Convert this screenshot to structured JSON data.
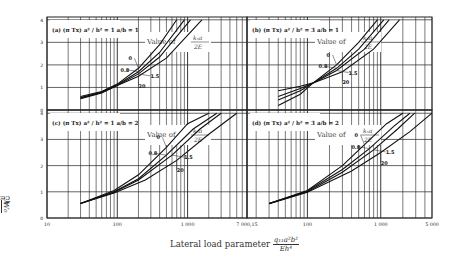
{
  "chart_data": {
    "type": "line",
    "title": "",
    "xlabel": "Lateral load parameter q11 a^2 b^2 / (E h^4)",
    "ylabel": "center deflection W0 / h",
    "x_scale": "log",
    "ylim": [
      0,
      4
    ],
    "legend_title": "Value of kx a / 2E",
    "series_keys": [
      "0",
      "0.8",
      "1.5",
      "20"
    ],
    "x_ticks_left": [
      "10",
      "100",
      "1 000",
      "7 000,15"
    ],
    "x_ticks_right": [
      "100",
      "1 000",
      "5 000"
    ],
    "y_ticks": [
      "0",
      "1",
      "2",
      "3",
      "4"
    ],
    "panels": [
      {
        "id": "a",
        "label": "(a)",
        "param": "(π Tx) a² / h² = 1",
        "ratio": "a/b = 1",
        "xrange": [
          10,
          7000
        ],
        "series": [
          {
            "name": "0",
            "x": [
              30,
              60,
              100,
              200,
              400,
              700
            ],
            "y": [
              0.6,
              0.82,
              1.15,
              1.85,
              2.9,
              4.0
            ]
          },
          {
            "name": "0.8",
            "x": [
              30,
              60,
              100,
              200,
              400,
              900
            ],
            "y": [
              0.55,
              0.8,
              1.12,
              1.7,
              2.55,
              4.0
            ]
          },
          {
            "name": "1.5",
            "x": [
              30,
              60,
              100,
              200,
              400,
              1100
            ],
            "y": [
              0.52,
              0.78,
              1.1,
              1.6,
              2.35,
              4.0
            ]
          },
          {
            "name": "20",
            "x": [
              30,
              60,
              100,
              200,
              500,
              1600
            ],
            "y": [
              0.5,
              0.76,
              1.08,
              1.5,
              2.3,
              4.0
            ]
          }
        ]
      },
      {
        "id": "b",
        "label": "(b)",
        "param": "(π Tx) a² / h² = 3",
        "ratio": "a/b = 1",
        "xrange": [
          15,
          5000
        ],
        "series": [
          {
            "name": "0",
            "x": [
              40,
              80,
              120,
              250,
              500,
              900
            ],
            "y": [
              0.2,
              0.7,
              1.2,
              2.0,
              3.0,
              4.0
            ]
          },
          {
            "name": "0.8",
            "x": [
              40,
              80,
              120,
              250,
              500,
              1100
            ],
            "y": [
              0.45,
              0.85,
              1.2,
              1.85,
              2.7,
              4.0
            ]
          },
          {
            "name": "1.5",
            "x": [
              40,
              80,
              120,
              250,
              600,
              1300
            ],
            "y": [
              0.6,
              0.95,
              1.2,
              1.75,
              2.7,
              4.0
            ]
          },
          {
            "name": "20",
            "x": [
              40,
              80,
              120,
              300,
              800,
              1800
            ],
            "y": [
              0.85,
              1.05,
              1.2,
              1.7,
              2.7,
              4.0
            ]
          }
        ]
      },
      {
        "id": "c",
        "label": "(c)",
        "param": "(π Tx) a² / h² = 1",
        "ratio": "a/b = 2",
        "xrange": [
          10,
          7000
        ],
        "series": [
          {
            "name": "0",
            "x": [
              30,
              90,
              200,
              500,
              1000,
              2000
            ],
            "y": [
              0.55,
              1.05,
              1.65,
              2.7,
              3.6,
              4.0
            ]
          },
          {
            "name": "0.8",
            "x": [
              30,
              90,
              200,
              500,
              1200,
              2600
            ],
            "y": [
              0.55,
              1.0,
              1.5,
              2.4,
              3.4,
              4.0
            ]
          },
          {
            "name": "1.5",
            "x": [
              30,
              90,
              200,
              600,
              1500,
              3000
            ],
            "y": [
              0.55,
              0.98,
              1.45,
              2.4,
              3.4,
              4.0
            ]
          },
          {
            "name": "20",
            "x": [
              30,
              90,
              250,
              700,
              2000,
              5000
            ],
            "y": [
              0.55,
              0.95,
              1.45,
              2.2,
              3.2,
              4.0
            ]
          }
        ]
      },
      {
        "id": "d",
        "label": "(d)",
        "param": "(π Tx) a² / h² = 3",
        "ratio": "a/b = 2",
        "xrange": [
          15,
          5000
        ],
        "series": [
          {
            "name": "0",
            "x": [
              30,
              100,
              300,
              600,
              1200,
              2000
            ],
            "y": [
              0.55,
              1.05,
              2.0,
              2.8,
              3.6,
              4.0
            ]
          },
          {
            "name": "0.8",
            "x": [
              30,
              100,
              300,
              700,
              1500,
              2500
            ],
            "y": [
              0.55,
              1.03,
              1.85,
              2.65,
              3.5,
              4.0
            ]
          },
          {
            "name": "1.5",
            "x": [
              30,
              100,
              300,
              800,
              1700,
              2900
            ],
            "y": [
              0.55,
              1.0,
              1.75,
              2.6,
              3.4,
              4.0
            ]
          },
          {
            "name": "20",
            "x": [
              30,
              100,
              400,
              1000,
              2500,
              5000
            ],
            "y": [
              0.55,
              0.98,
              1.8,
              2.5,
              3.3,
              4.0
            ]
          }
        ]
      }
    ]
  },
  "labels": {
    "y_axis_text": "center deflection",
    "y_axis_frac_num": "W₀",
    "y_axis_frac_den": "h",
    "x_axis_text": "Lateral load parameter",
    "x_axis_frac_num": "q₁₁a²b²",
    "x_axis_frac_den": "Eh⁴",
    "legend_prefix": "Value of",
    "legend_frac_num": "kₓa",
    "legend_frac_den": "2E"
  }
}
